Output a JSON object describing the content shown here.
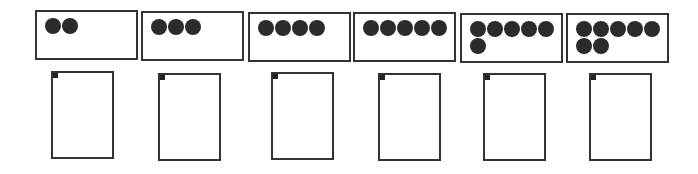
{
  "items": [
    {
      "dots": 2,
      "box": {
        "x": 35,
        "y": 10
      },
      "card": {
        "x": 51,
        "y": 71
      }
    },
    {
      "dots": 3,
      "box": {
        "x": 141,
        "y": 11
      },
      "card": {
        "x": 158,
        "y": 73
      }
    },
    {
      "dots": 4,
      "box": {
        "x": 248,
        "y": 12
      },
      "card": {
        "x": 271,
        "y": 72
      }
    },
    {
      "dots": 5,
      "box": {
        "x": 353,
        "y": 12
      },
      "card": {
        "x": 378,
        "y": 73
      }
    },
    {
      "dots": 6,
      "box": {
        "x": 460,
        "y": 13
      },
      "card": {
        "x": 483,
        "y": 73
      }
    },
    {
      "dots": 7,
      "box": {
        "x": 566,
        "y": 13
      },
      "card": {
        "x": 589,
        "y": 73
      }
    }
  ],
  "colors": {
    "stroke": "#333333",
    "dot": "#2b2b2b"
  }
}
